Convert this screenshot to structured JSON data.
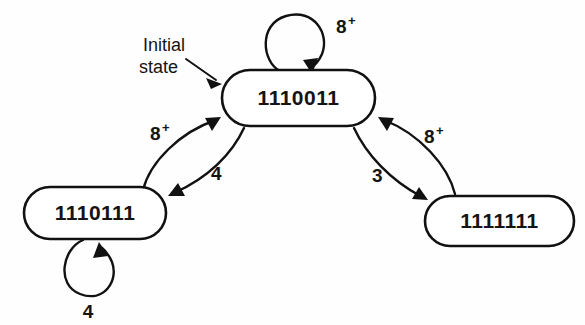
{
  "diagram": {
    "background_color": "#fefefe",
    "line_color": "#111111",
    "text_color": "#141414",
    "states": [
      {
        "id": "top",
        "label": "1110011",
        "x": 222,
        "y": 70,
        "width": 153,
        "height": 56,
        "is_initial": true
      },
      {
        "id": "left",
        "label": "1110111",
        "x": 24,
        "y": 187,
        "width": 142,
        "height": 52,
        "is_initial": false
      },
      {
        "id": "right",
        "label": "1111111",
        "x": 425,
        "y": 196,
        "width": 149,
        "height": 50,
        "is_initial": false
      }
    ],
    "self_loops": [
      {
        "id": "top-self-loop",
        "state": "top",
        "label": "8",
        "superscript": "+",
        "label_x": 336,
        "label_y": 33,
        "position": "above"
      },
      {
        "id": "left-self-loop",
        "state": "left",
        "label": "4",
        "superscript": "",
        "label_x": 88,
        "label_y": 312,
        "position": "below"
      }
    ],
    "transitions": [
      {
        "id": "left-to-top",
        "from": "left",
        "to": "top",
        "label": "8",
        "superscript": "+",
        "label_x": 150,
        "label_y": 140
      },
      {
        "id": "top-to-left",
        "from": "top",
        "to": "left",
        "label": "4",
        "superscript": "",
        "label_x": 211,
        "label_y": 180
      },
      {
        "id": "top-to-right",
        "from": "top",
        "to": "right",
        "label": "3",
        "superscript": "",
        "label_x": 372,
        "label_y": 182
      },
      {
        "id": "right-to-top",
        "from": "right",
        "to": "top",
        "label": "8",
        "superscript": "+",
        "label_x": 424,
        "label_y": 143
      }
    ],
    "annotations": [
      {
        "id": "initial-state-annotation",
        "line1": "Initial",
        "line2": "state",
        "line1_x": 185,
        "line1_y": 51,
        "line2_x": 185,
        "line2_y": 73,
        "points_to": "top"
      }
    ]
  }
}
